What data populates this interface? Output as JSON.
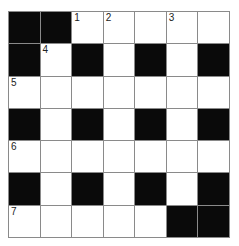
{
  "puzzle": {
    "rows": 7,
    "cols": 7,
    "grid": [
      [
        "B",
        "B",
        "W",
        "W",
        "W",
        "W",
        "W"
      ],
      [
        "B",
        "W",
        "B",
        "W",
        "B",
        "W",
        "B"
      ],
      [
        "W",
        "W",
        "W",
        "W",
        "W",
        "W",
        "W"
      ],
      [
        "B",
        "W",
        "B",
        "W",
        "B",
        "W",
        "B"
      ],
      [
        "W",
        "W",
        "W",
        "W",
        "W",
        "W",
        "W"
      ],
      [
        "B",
        "W",
        "B",
        "W",
        "B",
        "W",
        "B"
      ],
      [
        "W",
        "W",
        "W",
        "W",
        "W",
        "B",
        "B"
      ]
    ],
    "numbers": [
      {
        "row": 0,
        "col": 2,
        "label": "1"
      },
      {
        "row": 0,
        "col": 3,
        "label": "2"
      },
      {
        "row": 0,
        "col": 5,
        "label": "3"
      },
      {
        "row": 1,
        "col": 1,
        "label": "4"
      },
      {
        "row": 2,
        "col": 0,
        "label": "5"
      },
      {
        "row": 4,
        "col": 0,
        "label": "6"
      },
      {
        "row": 6,
        "col": 0,
        "label": "7"
      }
    ]
  }
}
